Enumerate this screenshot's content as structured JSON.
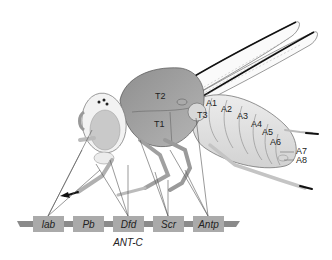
{
  "diagram": {
    "thorax_segments": [
      {
        "label": "T1",
        "x": 154,
        "y": 124
      },
      {
        "label": "T2",
        "x": 155,
        "y": 97
      },
      {
        "label": "T3",
        "x": 197,
        "y": 116
      }
    ],
    "abdomen_segments": [
      {
        "label": "A1",
        "x": 206,
        "y": 104
      },
      {
        "label": "A2",
        "x": 221,
        "y": 110
      },
      {
        "label": "A3",
        "x": 237,
        "y": 117
      },
      {
        "label": "A4",
        "x": 251,
        "y": 125
      },
      {
        "label": "A5",
        "x": 262,
        "y": 133
      },
      {
        "label": "A6",
        "x": 270,
        "y": 143
      },
      {
        "label": "A7",
        "x": 296,
        "y": 152
      },
      {
        "label": "A8",
        "x": 296,
        "y": 161
      }
    ],
    "gene_complex": {
      "label": "ANT-C",
      "genes": [
        {
          "label": "lab",
          "x": 33
        },
        {
          "label": "Pb",
          "x": 73
        },
        {
          "label": "Dfd",
          "x": 113
        },
        {
          "label": "Scr",
          "x": 153
        },
        {
          "label": "Antp",
          "x": 193
        }
      ]
    },
    "colors": {
      "gene_box": "#aaaaaa",
      "chromosome": "#888888",
      "thorax_dark": "#8a8a8a",
      "abdomen_light": "#e2e2e2",
      "head": "#eeeeee",
      "eye": "#c8c8c8",
      "line": "#555555"
    }
  }
}
